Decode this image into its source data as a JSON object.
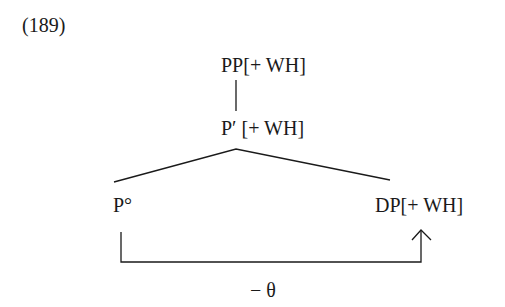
{
  "example_number": "(189)",
  "tree": {
    "root": {
      "label": "PP[+ WH]"
    },
    "bar": {
      "label": "P′ [+ WH]"
    },
    "head": {
      "label": "P°"
    },
    "complement": {
      "label": "DP[+ WH]"
    }
  },
  "relation": {
    "label": "− θ",
    "from": "P°",
    "to": "DP[+ WH]"
  },
  "colors": {
    "ink": "#1a1a1a",
    "background": "#ffffff"
  }
}
